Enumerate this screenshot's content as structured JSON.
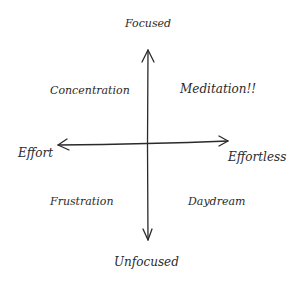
{
  "diagram": {
    "type": "quadrant",
    "axes": {
      "top": "Focused",
      "bottom": "Unfocused",
      "left": "Effort",
      "right": "Effortless"
    },
    "quadrants": {
      "top_left": "Concentration",
      "top_right": "Meditation!!",
      "bottom_left": "Frustration",
      "bottom_right": "Daydream"
    },
    "colors": {
      "ink": "#2a2a2a",
      "background": "#ffffff"
    }
  }
}
